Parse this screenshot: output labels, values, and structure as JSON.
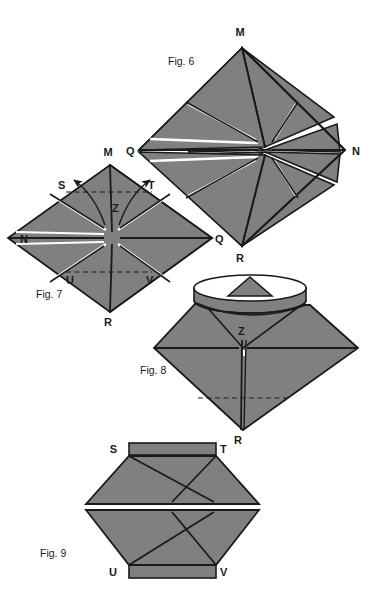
{
  "page": {
    "background_color": "#ffffff",
    "width": 374,
    "height": 604,
    "kind": "instructional line drawing sheet"
  },
  "palette": {
    "paper_fill": "#808080",
    "paper_fill_light": "#8a8a8a",
    "paper_fill_dark": "#6f6f6f",
    "outline": "#1a1a1a",
    "crease_line": "#1a1a1a",
    "dashed_line": "#1a1a1a",
    "gap_white": "#ffffff",
    "text": "#1a1a1a"
  },
  "figures": [
    {
      "id": "fig6",
      "caption": "Fig. 6",
      "caption_x": 168,
      "caption_y": 65,
      "shape": "square rotated 45 degrees (diamond) divided into eight triangular flaps radiating from centre",
      "vertex_labels": [
        {
          "text": "M",
          "x": 242,
          "y": 36,
          "at": "top"
        },
        {
          "text": "N",
          "x": 352,
          "y": 144,
          "at": "right"
        },
        {
          "text": "Q",
          "x": 186,
          "y": 144,
          "at": "left"
        },
        {
          "text": "R",
          "x": 242,
          "y": 251,
          "at": "bottom"
        }
      ]
    },
    {
      "id": "fig7",
      "caption": "Fig. 7",
      "caption_x": 36,
      "caption_y": 298,
      "shape": "same diamond with upper-left and upper-right flaps marked S and T being peeled outward, lower flaps marked U and V, centre point Z",
      "vertex_labels": [
        {
          "text": "M",
          "x": 107,
          "y": 153,
          "at": "top"
        },
        {
          "text": "N",
          "x": 29,
          "y": 231,
          "at": "left"
        },
        {
          "text": "Q",
          "x": 212,
          "y": 231,
          "at": "right"
        },
        {
          "text": "R",
          "x": 107,
          "y": 314,
          "at": "bottom"
        },
        {
          "text": "S",
          "x": 63,
          "y": 186,
          "at": "upper-left flap"
        },
        {
          "text": "T",
          "x": 146,
          "y": 186,
          "at": "upper-right flap"
        },
        {
          "text": "Z",
          "x": 115,
          "y": 208,
          "at": "centre"
        },
        {
          "text": "U",
          "x": 73,
          "y": 277,
          "at": "lower-left flap"
        },
        {
          "text": "V",
          "x": 145,
          "y": 277,
          "at": "lower-right flap"
        }
      ],
      "arrows": [
        {
          "name": "fold-arrow-left",
          "direction": "outward to upper-left"
        },
        {
          "name": "fold-arrow-right",
          "direction": "outward to upper-right"
        }
      ],
      "dashed_creases": 2
    },
    {
      "id": "fig8",
      "caption": "Fig. 8",
      "caption_x": 140,
      "caption_y": 374,
      "shape": "three-dimensional view: open elliptical collar at top with a small triangular flap showing through, kite shaped body below, centre point Z, bottom point R",
      "vertex_labels": [
        {
          "text": "Z",
          "x": 243,
          "y": 331,
          "at": "centre"
        },
        {
          "text": "R",
          "x": 231,
          "y": 433,
          "at": "bottom"
        }
      ],
      "dashed_creases": 1
    },
    {
      "id": "fig9",
      "caption": "Fig. 9",
      "caption_x": 40,
      "caption_y": 557,
      "shape": "flattened hexagon with an X of creases and a horizontal split across the middle, rectangular tabs along the top edge (S to T) and the bottom edge (U to V)",
      "vertex_labels": [
        {
          "text": "S",
          "x": 120,
          "y": 452,
          "at": "top-left tab"
        },
        {
          "text": "T",
          "x": 221,
          "y": 452,
          "at": "top-right tab"
        },
        {
          "text": "U",
          "x": 120,
          "y": 573,
          "at": "bottom-left tab"
        },
        {
          "text": "V",
          "x": 221,
          "y": 573,
          "at": "bottom-right tab"
        }
      ]
    }
  ]
}
